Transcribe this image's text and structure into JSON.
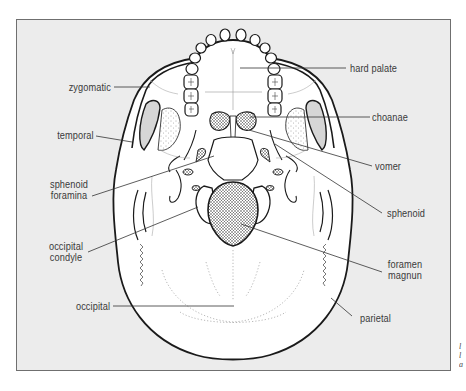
{
  "figure": {
    "colors": {
      "panel_bg": "#ececec",
      "panel_border": "#6f6f6f",
      "bone": "#ffffff",
      "outline": "#1a1a1a",
      "label_text": "#3a3a3a",
      "leader_line": "#333333"
    }
  },
  "labels": {
    "zygomatic": "zygomatic",
    "temporal": "temporal",
    "sphenoid_foramina_1": "sphenoid",
    "sphenoid_foramina_2": "foramina",
    "occipital_condyle_1": "occipital",
    "occipital_condyle_2": "condyle",
    "occipital": "occipital",
    "hard_palate": "hard palate",
    "choanae": "choanae",
    "vomer": "vomer",
    "sphenoid": "sphenoid",
    "foramen_magnum_1": "foramen",
    "foramen_magnum_2": "magnun",
    "parietal": "parietal"
  },
  "margin_note": [
    "l",
    "l",
    "a"
  ]
}
